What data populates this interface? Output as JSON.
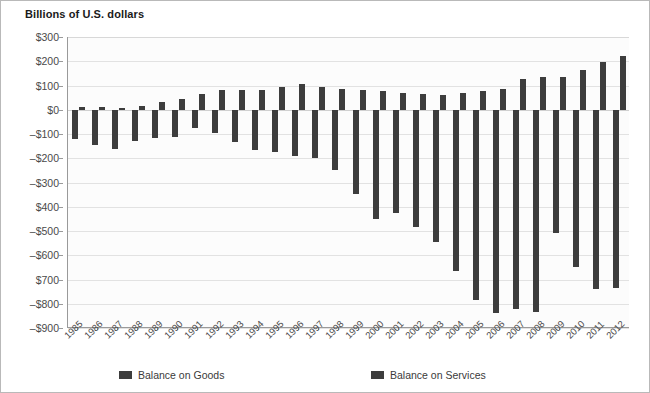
{
  "chart_title": "Billions of U.S. dollars",
  "legend": {
    "goods": "Balance on Goods",
    "services": "Balance on Services"
  },
  "axis": {
    "y_ticks": [
      "$300",
      "$200",
      "$100",
      "$0",
      "–$100",
      "–$200",
      "–$300",
      "$400",
      "–$500",
      "–$600",
      "$700",
      "–$800",
      "–$900"
    ],
    "x_ticks": [
      "1985",
      "1986",
      "1987",
      "1988",
      "1989",
      "1990",
      "1991",
      "1992",
      "1993",
      "1994",
      "1995",
      "1996",
      "1997",
      "1998",
      "1999",
      "2000",
      "2001",
      "2002",
      "2003",
      "2004",
      "2005",
      "2006",
      "2007",
      "2008",
      "2009",
      "2010",
      "2011",
      "2012"
    ]
  },
  "colors": {
    "bar": "#3d3d3d",
    "grid": "#e2e2e2",
    "axis": "#9a9a9a",
    "plot_background": "#fcfcfc",
    "text": "#4a4a4a"
  },
  "chart_data": {
    "type": "bar",
    "title": "Billions of U.S. dollars",
    "xlabel": "",
    "ylabel": "Billions of U.S. dollars",
    "ylim": [
      -900,
      300
    ],
    "ytick_values": [
      300,
      200,
      100,
      0,
      -100,
      -200,
      -300,
      -400,
      -500,
      -600,
      -700,
      -800,
      -900
    ],
    "grid": true,
    "legend_position": "bottom",
    "categories": [
      "1985",
      "1986",
      "1987",
      "1988",
      "1989",
      "1990",
      "1991",
      "1992",
      "1993",
      "1994",
      "1995",
      "1996",
      "1997",
      "1998",
      "1999",
      "2000",
      "2001",
      "2002",
      "2003",
      "2004",
      "2005",
      "2006",
      "2007",
      "2008",
      "2009",
      "2010",
      "2011",
      "2012"
    ],
    "series": [
      {
        "name": "Balance on Goods",
        "values": [
          -122,
          -145,
          -160,
          -127,
          -115,
          -111,
          -77,
          -97,
          -132,
          -166,
          -174,
          -191,
          -198,
          -247,
          -346,
          -452,
          -427,
          -482,
          -547,
          -665,
          -783,
          -837,
          -821,
          -833,
          -510,
          -648,
          -741,
          -735
        ]
      },
      {
        "name": "Balance on Services",
        "values": [
          13,
          10,
          8,
          17,
          33,
          46,
          64,
          81,
          82,
          80,
          94,
          105,
          92,
          84,
          83,
          77,
          68,
          66,
          61,
          69,
          78,
          87,
          125,
          134,
          133,
          164,
          197,
          220
        ]
      }
    ]
  }
}
